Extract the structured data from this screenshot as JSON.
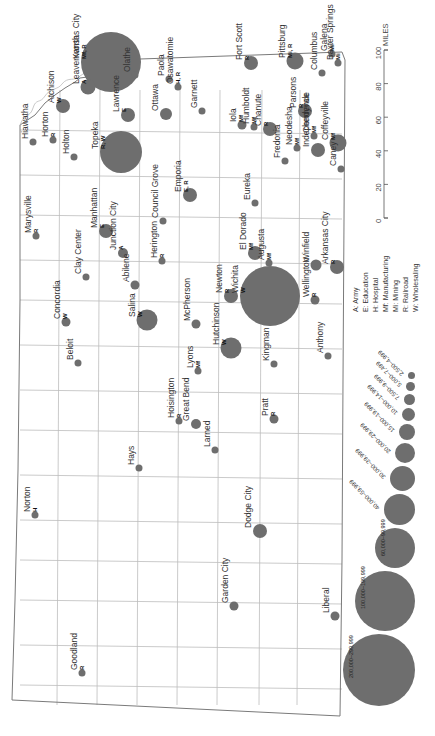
{
  "map": {
    "orientation": "rotated 90° (north to the left)",
    "scale": {
      "unit": "MILES",
      "ticks": [
        "0",
        "20",
        "40",
        "60",
        "80",
        "100"
      ]
    },
    "legend_functions": [
      {
        "code": "A",
        "label": "A: Army"
      },
      {
        "code": "E",
        "label": "E: Education"
      },
      {
        "code": "H",
        "label": "H: Hospital"
      },
      {
        "code": "Mf",
        "label": "Mf: Manufacturing"
      },
      {
        "code": "Mi",
        "label": "Mi: Mining"
      },
      {
        "code": "R",
        "label": "R: Railroad"
      },
      {
        "code": "W",
        "label": "W: Wholesaling"
      }
    ],
    "legend_sizes": [
      {
        "label": "2,500–4,999",
        "r": 3.5
      },
      {
        "label": "5,000–7,499",
        "r": 4.5
      },
      {
        "label": "7,500–9,999",
        "r": 5.5
      },
      {
        "label": "10,000–14,999",
        "r": 6.5
      },
      {
        "label": "15,000–19,999",
        "r": 8
      },
      {
        "label": "20,000–29,999",
        "r": 10
      },
      {
        "label": "30,000–39,999",
        "r": 12.5
      },
      {
        "label": "40,000–59,999",
        "r": 15.5
      },
      {
        "label": "60,000–99,999",
        "r": 20
      },
      {
        "label": "100,000–199,999",
        "r": 30
      },
      {
        "label": "200,000–299,999",
        "r": 36
      }
    ],
    "cities": [
      {
        "name": "Kansas City",
        "func": "Mf, R",
        "x": 111,
        "y": 62,
        "r": 30
      },
      {
        "name": "Olathe",
        "func": "",
        "x": 135,
        "y": 75,
        "r": 3.5
      },
      {
        "name": "Leavenworth",
        "func": "A",
        "x": 88,
        "y": 87,
        "r": 7.5
      },
      {
        "name": "Atchison",
        "func": "W",
        "x": 63,
        "y": 106,
        "r": 7
      },
      {
        "name": "Lawrence",
        "func": "E",
        "x": 128,
        "y": 115,
        "r": 7
      },
      {
        "name": "Topeka",
        "func": "R, W",
        "x": 121,
        "y": 152,
        "r": 21
      },
      {
        "name": "Paola",
        "func": "",
        "x": 169,
        "y": 79,
        "r": 3.5
      },
      {
        "name": "Osawatomie",
        "func": "H, R",
        "x": 178,
        "y": 87,
        "r": 3.5
      },
      {
        "name": "Ottawa",
        "func": "",
        "x": 166,
        "y": 114,
        "r": 6
      },
      {
        "name": "Garnett",
        "func": "",
        "x": 202,
        "y": 111,
        "r": 3.5
      },
      {
        "name": "Fort Scott",
        "func": "R",
        "x": 251,
        "y": 63,
        "r": 7
      },
      {
        "name": "Pittsburg",
        "func": "Mi, R",
        "x": 295,
        "y": 61,
        "r": 8.5
      },
      {
        "name": "Columbus",
        "func": "",
        "x": 322,
        "y": 73,
        "r": 3.5
      },
      {
        "name": "Galena",
        "func": "Mi",
        "x": 332,
        "y": 54,
        "r": 3.5
      },
      {
        "name": "Baxter Springs",
        "func": "Mi",
        "x": 338,
        "y": 63,
        "r": 3.5
      },
      {
        "name": "Iola",
        "func": "Mf",
        "x": 242,
        "y": 125,
        "r": 4.5
      },
      {
        "name": "Humboldt",
        "func": "Mf",
        "x": 254,
        "y": 127,
        "r": 3.5
      },
      {
        "name": "Chanute",
        "func": "R",
        "x": 270,
        "y": 129,
        "r": 7
      },
      {
        "name": "Parsons",
        "func": "R",
        "x": 305,
        "y": 111,
        "r": 7
      },
      {
        "name": "Neodesha",
        "func": "Mf",
        "x": 297,
        "y": 148,
        "r": 3.5
      },
      {
        "name": "Cherryvale",
        "func": "Mf",
        "x": 314,
        "y": 136,
        "r": 3.5
      },
      {
        "name": "Coffeyville",
        "func": "Mf",
        "x": 338,
        "y": 143,
        "r": 8.5
      },
      {
        "name": "Independence",
        "func": "",
        "x": 318,
        "y": 150,
        "r": 7
      },
      {
        "name": "Fredonia",
        "func": "",
        "x": 285,
        "y": 161,
        "r": 3.5
      },
      {
        "name": "Caney",
        "func": "",
        "x": 341,
        "y": 169,
        "r": 3.5
      },
      {
        "name": "Hiawatha",
        "func": "",
        "x": 33,
        "y": 142,
        "r": 3.5
      },
      {
        "name": "Horton",
        "func": "R",
        "x": 53,
        "y": 140,
        "r": 3.5
      },
      {
        "name": "Holton",
        "func": "",
        "x": 74,
        "y": 157,
        "r": 3.5
      },
      {
        "name": "Emporia",
        "func": "E, R",
        "x": 190,
        "y": 195,
        "r": 7
      },
      {
        "name": "Eureka",
        "func": "",
        "x": 255,
        "y": 203,
        "r": 3.5
      },
      {
        "name": "Council Grove",
        "func": "",
        "x": 163,
        "y": 221,
        "r": 3.5
      },
      {
        "name": "Marysville",
        "func": "R",
        "x": 36,
        "y": 236,
        "r": 3.5
      },
      {
        "name": "Manhattan",
        "func": "E",
        "x": 106,
        "y": 231,
        "r": 7
      },
      {
        "name": "El Dorado",
        "func": "Mf",
        "x": 255,
        "y": 253,
        "r": 7
      },
      {
        "name": "Augusta",
        "func": "Mf",
        "x": 269,
        "y": 263,
        "r": 3.5
      },
      {
        "name": "Winfield",
        "func": "",
        "x": 316,
        "y": 265,
        "r": 5.5
      },
      {
        "name": "Arkansas City",
        "func": "R",
        "x": 337,
        "y": 267,
        "r": 7
      },
      {
        "name": "Clay Center",
        "func": "",
        "x": 86,
        "y": 277,
        "r": 3.5
      },
      {
        "name": "Junction City",
        "func": "A",
        "x": 123,
        "y": 253,
        "r": 5
      },
      {
        "name": "Abilene",
        "func": "",
        "x": 135,
        "y": 285,
        "r": 4.5
      },
      {
        "name": "Herington",
        "func": "R",
        "x": 162,
        "y": 261,
        "r": 3.5
      },
      {
        "name": "Newton",
        "func": "R",
        "x": 231,
        "y": 296,
        "r": 7
      },
      {
        "name": "Wichita",
        "func": "W",
        "x": 270,
        "y": 296,
        "r": 30
      },
      {
        "name": "Wellington",
        "func": "R",
        "x": 315,
        "y": 300,
        "r": 4.5
      },
      {
        "name": "Anthony",
        "func": "",
        "x": 328,
        "y": 356,
        "r": 3.5
      },
      {
        "name": "Concordia",
        "func": "W",
        "x": 66,
        "y": 322,
        "r": 4.5
      },
      {
        "name": "Salina",
        "func": "W",
        "x": 147,
        "y": 320,
        "r": 10.5
      },
      {
        "name": "McPherson",
        "func": "",
        "x": 196,
        "y": 324,
        "r": 4.5
      },
      {
        "name": "Hutchinson",
        "func": "W",
        "x": 231,
        "y": 348,
        "r": 10.5
      },
      {
        "name": "Beloit",
        "func": "",
        "x": 78,
        "y": 363,
        "r": 3.5
      },
      {
        "name": "Lyons",
        "func": "Mf",
        "x": 198,
        "y": 371,
        "r": 3.5
      },
      {
        "name": "Kingman",
        "func": "",
        "x": 274,
        "y": 364,
        "r": 3.5
      },
      {
        "name": "Hoisington",
        "func": "R",
        "x": 179,
        "y": 421,
        "r": 3.5
      },
      {
        "name": "Great Bend",
        "func": "",
        "x": 196,
        "y": 424,
        "r": 5
      },
      {
        "name": "Pratt",
        "func": "R",
        "x": 274,
        "y": 419,
        "r": 4.5
      },
      {
        "name": "Hays",
        "func": "",
        "x": 139,
        "y": 468,
        "r": 3.5
      },
      {
        "name": "Larned",
        "func": "",
        "x": 215,
        "y": 450,
        "r": 3.5
      },
      {
        "name": "Norton",
        "func": "H",
        "x": 35,
        "y": 515,
        "r": 3.5
      },
      {
        "name": "Dodge City",
        "func": "",
        "x": 260,
        "y": 531,
        "r": 7
      },
      {
        "name": "Garden City",
        "func": "",
        "x": 234,
        "y": 606,
        "r": 4.5
      },
      {
        "name": "Liberal",
        "func": "",
        "x": 335,
        "y": 616,
        "r": 4.5
      },
      {
        "name": "Goodland",
        "func": "R",
        "x": 82,
        "y": 673,
        "r": 3.5
      }
    ]
  }
}
